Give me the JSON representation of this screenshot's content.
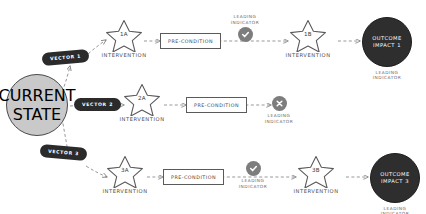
{
  "diagram": {
    "colors": {
      "background": "#ffffff",
      "state_fill": "#c9c9c9",
      "pill_fill": "#2b2b2b",
      "outcome_fill": "#2e2e2e",
      "indicator_fill": "#7d7d7d",
      "stroke": "#4a4a4a"
    },
    "start_node": {
      "line1": "CURRENT",
      "line2": "STATE"
    },
    "rows": [
      {
        "vector_label": "VECTOR 1",
        "intervention_a": {
          "number": "1A",
          "caption": "INTERVENTION"
        },
        "precondition": "PRE-CONDITION",
        "indicator": {
          "caption_line1": "LEADING",
          "caption_line2": "INDICATOR",
          "mark": "check",
          "caption_position": "above"
        },
        "intervention_b": {
          "number": "1B",
          "caption": "INTERVENTION"
        },
        "outcome": {
          "line1": "OUTCOME",
          "line2": "IMPACT 1",
          "caption_line1": "LEADING",
          "caption_line2": "INDICATOR"
        }
      },
      {
        "vector_label": "VECTOR 2",
        "intervention_a": {
          "number": "2A",
          "caption": "INTERVENTION"
        },
        "precondition": "PRE-CONDITION",
        "indicator": {
          "caption_line1": "LEADING",
          "caption_line2": "INDICATOR",
          "mark": "x",
          "caption_position": "below"
        },
        "intervention_b": null,
        "outcome": null
      },
      {
        "vector_label": "VECTOR 3",
        "intervention_a": {
          "number": "3A",
          "caption": "INTERVENTION"
        },
        "precondition": "PRE-CONDITION",
        "indicator": {
          "caption_line1": "LEADING",
          "caption_line2": "INDICATOR",
          "mark": "check",
          "caption_position": "below"
        },
        "intervention_b": {
          "number": "3B",
          "caption": "INTERVENTION"
        },
        "outcome": {
          "line1": "OUTCOME",
          "line2": "IMPACT 3",
          "caption_line1": "LEADING",
          "caption_line2": "INDICATOR"
        }
      }
    ]
  }
}
